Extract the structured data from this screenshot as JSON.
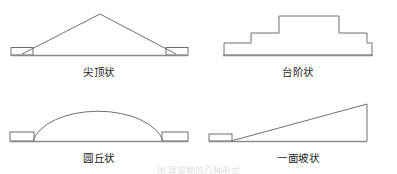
{
  "figure": {
    "background_color": "#ffffff",
    "stroke_color": "#6e6e6e",
    "ground_color": "#8a8a8a",
    "label_color": "#1a1a1a",
    "caption": "图 建筑物的几种形式"
  },
  "panels": [
    {
      "id": "pointed-top",
      "label": "尖顶状",
      "shape_type": "triangle-peak",
      "description": "low wide triangle with apex at center, small rectangular blocks at both base corners"
    },
    {
      "id": "stepped",
      "label": "台阶状",
      "shape_type": "stepped-terrace",
      "description": "symmetric three-tier stepped block profile on a ground line"
    },
    {
      "id": "round-mound",
      "label": "圆丘状",
      "shape_type": "dome-arc",
      "description": "elliptical dome arc with small rectangular blocks at both base ends"
    },
    {
      "id": "single-slope",
      "label": "一面坡状",
      "shape_type": "ramp-right-triangle",
      "description": "right triangle rising from left to a tall vertical edge at right, small block at left base"
    }
  ]
}
